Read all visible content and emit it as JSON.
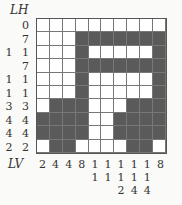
{
  "puzzle": {
    "row_header": "LH",
    "col_header": "LV",
    "row_clues": [
      "0",
      "7",
      "1 1",
      "7",
      "1 1",
      "1 1",
      "3 3",
      "4 4",
      "4 4",
      "2 2"
    ],
    "col_clues": [
      [
        "2"
      ],
      [
        "4"
      ],
      [
        "4"
      ],
      [
        "8"
      ],
      [
        "1",
        "1"
      ],
      [
        "1",
        "1"
      ],
      [
        "1",
        "1",
        "2"
      ],
      [
        "1",
        "1",
        "4"
      ],
      [
        "1",
        "1",
        "4"
      ],
      [
        "8"
      ]
    ],
    "grid": [
      [
        0,
        0,
        0,
        0,
        0,
        0,
        0,
        0,
        0,
        0
      ],
      [
        0,
        0,
        0,
        1,
        1,
        1,
        1,
        1,
        1,
        1
      ],
      [
        0,
        0,
        0,
        1,
        0,
        0,
        0,
        0,
        0,
        1
      ],
      [
        0,
        0,
        0,
        1,
        1,
        1,
        1,
        1,
        1,
        1
      ],
      [
        0,
        0,
        0,
        1,
        0,
        0,
        0,
        0,
        0,
        1
      ],
      [
        0,
        0,
        0,
        1,
        0,
        0,
        0,
        0,
        0,
        1
      ],
      [
        0,
        1,
        1,
        1,
        0,
        0,
        0,
        1,
        1,
        1
      ],
      [
        1,
        1,
        1,
        1,
        0,
        0,
        1,
        1,
        1,
        1
      ],
      [
        1,
        1,
        1,
        1,
        0,
        0,
        1,
        1,
        1,
        1
      ],
      [
        0,
        1,
        1,
        0,
        0,
        0,
        0,
        1,
        1,
        0
      ]
    ],
    "colors": {
      "filled": "#5a5a5a",
      "empty": "#ffffff",
      "grid_line": "#777777"
    }
  }
}
